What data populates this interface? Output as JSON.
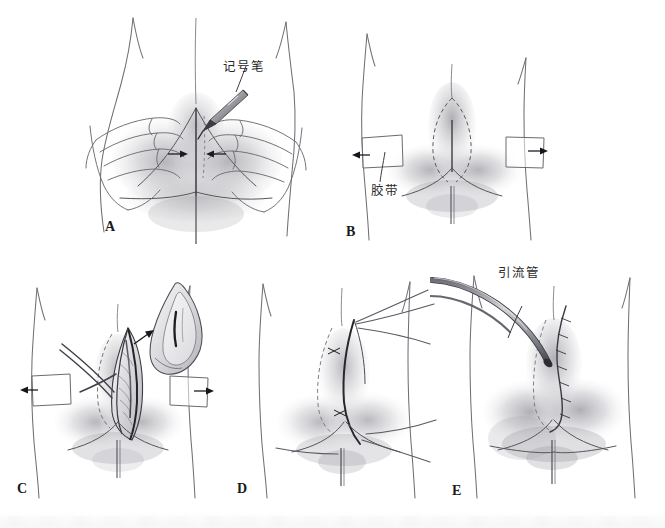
{
  "figure": {
    "background_color": "#ffffff",
    "ink_color": "#2b2b2b",
    "wash_color": "#8d8d93",
    "panel_count": 5
  },
  "panels": [
    {
      "letter": "A",
      "caption": "",
      "description": "Two hands press the buttocks together while a marker pen draws the midline over the natal cleft; opposing arrows show medial compression.",
      "annotations": [
        {
          "id": "marker-pen",
          "text": "记号笔",
          "meaning": "marker pen"
        }
      ],
      "arrows": [
        "medial-left",
        "medial-right"
      ]
    },
    {
      "letter": "B",
      "caption": "",
      "description": "Adhesive tape strips on each buttock retract laterally, exposing the dashed planned elliptical excision outline over the sinus.",
      "annotations": [
        {
          "id": "adhesive-tape",
          "text": "胶带",
          "meaning": "adhesive tape"
        }
      ],
      "arrows": [
        "lateral-left",
        "lateral-right"
      ]
    },
    {
      "letter": "C",
      "caption": "",
      "description": "The wound is opened; the excised elliptical specimen containing the sinus tract is lifted away to the upper right.",
      "annotations": [],
      "arrows": [
        "specimen-removal",
        "lateral-left",
        "lateral-right"
      ]
    },
    {
      "letter": "D",
      "caption": "",
      "description": "Interrupted sutures are placed and held under tension, drawing the wound edge off midline.",
      "annotations": [],
      "arrows": []
    },
    {
      "letter": "E",
      "caption": "",
      "description": "Closure complete with an off-midline suture line and a drainage tube exiting the superolateral corner of the wound.",
      "annotations": [
        {
          "id": "drainage-tube",
          "text": "引流管",
          "meaning": "drainage tube"
        }
      ],
      "arrows": []
    }
  ],
  "labels": {
    "a": "A",
    "b": "B",
    "c": "C",
    "d": "D",
    "e": "E",
    "marker_pen": "记号笔",
    "adhesive_tape": "胶带",
    "drainage_tube": "引流管"
  }
}
